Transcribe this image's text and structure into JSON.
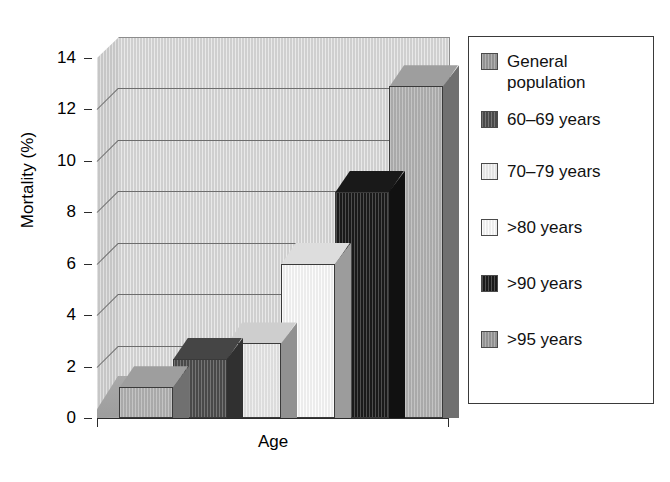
{
  "chart_data": {
    "type": "bar",
    "title": "",
    "xlabel": "Age",
    "ylabel": "Mortality (%)",
    "categories": [
      "General population",
      "60–69 years",
      "70–79 years",
      ">80 years",
      ">90 years",
      ">95 years"
    ],
    "values": [
      1.2,
      2.3,
      2.9,
      6.0,
      8.8,
      12.9
    ],
    "ylim": [
      0,
      14
    ],
    "yticks": [
      0,
      2,
      4,
      6,
      8,
      10,
      12,
      14
    ],
    "ytick_labels": [
      "0",
      "2",
      "4",
      "6",
      "8",
      "10",
      "12",
      "14"
    ],
    "xtick_labels": [],
    "grid": true,
    "legend_position": "right",
    "style": "3d-bar-grayscale",
    "bar_colors": [
      "#b4b4b4",
      "#4e4e4e",
      "#eaeaea",
      "#fbfbfb",
      "#1c1c1c",
      "#b4b4b4"
    ],
    "legend_entries": [
      {
        "label": "General\npopulation",
        "color": "#9b9b9b"
      },
      {
        "label": "60–69 years",
        "color": "#4e4e4e"
      },
      {
        "label": "70–79 years",
        "color": "#f2f2f2"
      },
      {
        "label": ">80 years",
        "color": "#fcfcfc"
      },
      {
        "label": ">90 years",
        "color": "#1c1c1c"
      },
      {
        "label": ">95 years",
        "color": "#9b9b9b"
      }
    ]
  },
  "axes": {
    "y_title": "Mortality (%)",
    "x_title": "Age",
    "y_labels": [
      "14",
      "12",
      "10",
      "8",
      "6",
      "4",
      "2",
      "0"
    ]
  },
  "legend": {
    "items": [
      {
        "label": "General\npopulation"
      },
      {
        "label": "60–69 years"
      },
      {
        "label": "70–79 years"
      },
      {
        "label": ">80 years"
      },
      {
        "label": ">90 years"
      },
      {
        "label": ">95 years"
      }
    ]
  }
}
